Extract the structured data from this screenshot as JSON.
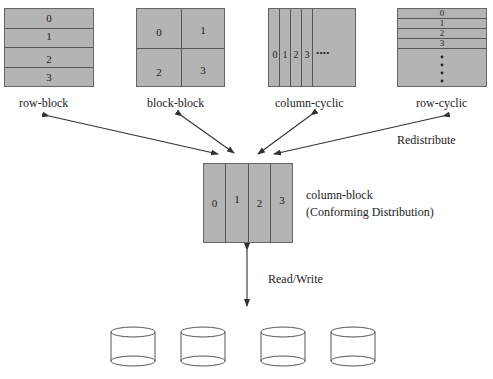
{
  "diagram": {
    "distributions": [
      {
        "id": "row-block",
        "label": "row-block",
        "cells": [
          "0",
          "1",
          "2",
          "3"
        ]
      },
      {
        "id": "block-block",
        "label": "block-block",
        "cells": [
          "0",
          "1",
          "2",
          "3"
        ]
      },
      {
        "id": "column-cyclic",
        "label": "column-cyclic",
        "cells": [
          "0",
          "1",
          "2",
          "3"
        ],
        "ellipsis": "• • • •"
      },
      {
        "id": "row-cyclic",
        "label": "row-cyclic",
        "cells": [
          "0",
          "1",
          "2",
          "3"
        ],
        "ellipsis": "•"
      }
    ],
    "center": {
      "label": "column-block",
      "sublabel": "(Conforming Distribution)",
      "cells": [
        "0",
        "1",
        "2",
        "3"
      ]
    },
    "edges": {
      "redistribute_label": "Redistribute",
      "readwrite_label": "Read/Write"
    },
    "disks": {
      "count": 4
    },
    "colors": {
      "fill": "#b4b4b4",
      "line": "#555555",
      "arrow": "#333333"
    }
  }
}
